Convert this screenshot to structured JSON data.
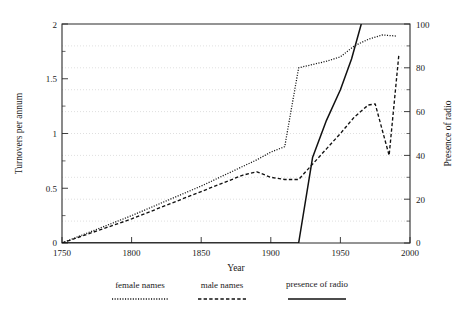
{
  "chart_data": {
    "type": "line",
    "title": "",
    "xlabel": "Year",
    "ylabel": "Turnovers per annum",
    "y2label": "Presence of radio",
    "xlim": [
      1750,
      2000
    ],
    "ylim": [
      0,
      2
    ],
    "y2lim": [
      0,
      100
    ],
    "xticks": [
      1750,
      1800,
      1850,
      1900,
      1950,
      2000
    ],
    "xticklabels": [
      "1750",
      "1800",
      "1850",
      "1900",
      "1950",
      "2000"
    ],
    "yticks": [
      0,
      0.5,
      1,
      1.5,
      2
    ],
    "yticklabels": [
      "0",
      "0.5",
      "1",
      "1.5",
      "2"
    ],
    "y2ticks": [
      0,
      20,
      40,
      60,
      80,
      100
    ],
    "y2ticklabels": [
      "0",
      "20",
      "40",
      "60",
      "80",
      "100"
    ],
    "grid": true,
    "grid_axis": "y",
    "grid_style": "dotted",
    "legend_position": "below-outside",
    "series": [
      {
        "name": "female names",
        "style": "dotted",
        "axis": "left",
        "x": [
          1750,
          1800,
          1850,
          1880,
          1890,
          1900,
          1910,
          1920,
          1930,
          1940,
          1950,
          1960,
          1970,
          1980,
          1990
        ],
        "values": [
          0.0,
          0.25,
          0.52,
          0.7,
          0.76,
          0.83,
          0.88,
          1.6,
          1.63,
          1.66,
          1.7,
          1.8,
          1.86,
          1.9,
          1.89
        ]
      },
      {
        "name": "male names",
        "style": "dashed",
        "axis": "left",
        "x": [
          1750,
          1800,
          1850,
          1880,
          1890,
          1900,
          1910,
          1920,
          1930,
          1940,
          1950,
          1960,
          1970,
          1975,
          1985,
          1992
        ],
        "values": [
          0.0,
          0.22,
          0.47,
          0.62,
          0.65,
          0.6,
          0.58,
          0.58,
          0.72,
          0.86,
          1.0,
          1.15,
          1.26,
          1.27,
          0.8,
          1.72
        ]
      },
      {
        "name": "presence of radio",
        "style": "solid",
        "axis": "right",
        "x": [
          1750,
          1900,
          1920,
          1930,
          1940,
          1950,
          1958,
          1965
        ],
        "values": [
          0,
          0,
          0,
          39,
          56,
          70,
          84,
          100
        ]
      }
    ]
  },
  "legend": {
    "entries": [
      {
        "label": "female names",
        "swatch": "dotted-line-swatch"
      },
      {
        "label": "male names",
        "swatch": "dashed-line-swatch"
      },
      {
        "label": "presence of radio",
        "swatch": "solid-line-swatch"
      }
    ]
  }
}
